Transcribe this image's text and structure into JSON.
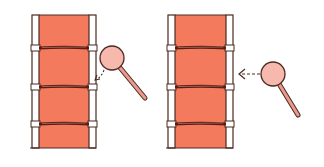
{
  "colors": {
    "background": "#ffffff",
    "film_fill": "#f47a5e",
    "outline": "#4a2a22",
    "band": "#5a1e14",
    "lens_fill": "#f7b8ae",
    "handle_fill": "#e99a8c"
  },
  "panels": [
    {
      "id": "left",
      "strip": {
        "x": 32,
        "y": 15,
        "w": 64,
        "h": 133,
        "rail_w": 7
      },
      "bands_y": [
        48,
        87,
        124
      ],
      "magnifier": {
        "cx": 112,
        "cy": 58,
        "r": 12,
        "handle_end": [
          145,
          98
        ]
      },
      "arrow": {
        "type": "dashed-curved",
        "from": [
          104,
          70
        ],
        "to": [
          95,
          80
        ]
      }
    },
    {
      "id": "right",
      "strip": {
        "x": 168,
        "y": 15,
        "w": 65,
        "h": 133,
        "rail_w": 7
      },
      "bands_y": [
        48,
        87,
        124
      ],
      "magnifier": {
        "cx": 273,
        "cy": 74,
        "r": 12,
        "handle_end": [
          298,
          115
        ]
      },
      "arrow": {
        "type": "dashed-straight",
        "from": [
          260,
          74
        ],
        "to": [
          239,
          74
        ]
      }
    }
  ]
}
